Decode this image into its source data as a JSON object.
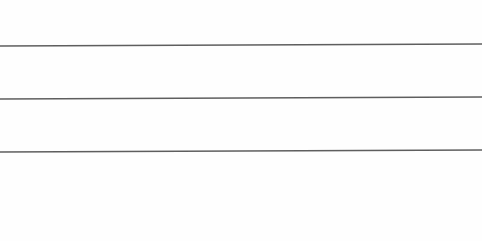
{
  "document": {
    "type": "blank ruled writing lines",
    "background_color": "#fefefe",
    "line_color": "#5e5e5e",
    "line_thickness_px": 1.4,
    "lines": [
      {
        "label": "",
        "y_left": 46,
        "y_right": 44
      },
      {
        "label": "",
        "y_left": 99,
        "y_right": 97
      },
      {
        "label": "",
        "y_left": 152,
        "y_right": 150
      }
    ]
  }
}
